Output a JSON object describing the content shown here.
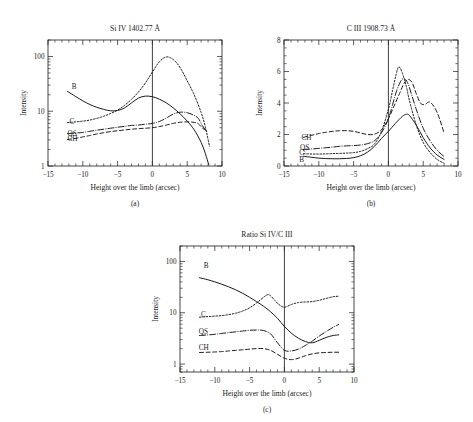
{
  "figure": {
    "panel_captions": [
      "(a)",
      "(b)",
      "(c)"
    ]
  },
  "chart_data": [
    {
      "type": "line",
      "panel": "(a)",
      "title": "Si IV 1402.77 Å",
      "xlabel": "Height over the limb (arcsec)",
      "ylabel": "Intensity",
      "xlim": [
        -15,
        10
      ],
      "ylim": [
        1,
        200
      ],
      "yscale": "log",
      "xscale": "linear",
      "xticks": [
        -15,
        -10,
        -5,
        0,
        5,
        10
      ],
      "xtick_labels": [
        "−15",
        "−10",
        "−5",
        "0",
        "5",
        "10"
      ],
      "yticks": [
        1,
        10,
        100
      ],
      "ytick_labels": [
        "1",
        "10",
        "100"
      ],
      "grid": false,
      "legend": "inline-labels",
      "annotations": [
        {
          "text": "B",
          "x": -11.6,
          "y": 28
        },
        {
          "text": "C",
          "x": -11.9,
          "y": 6.6
        },
        {
          "text": "QS",
          "x": -12.2,
          "y": 4.0
        },
        {
          "text": "CH",
          "x": -12.2,
          "y": 3.2
        }
      ],
      "reference_line_x": 0,
      "series": [
        {
          "name": "B",
          "style": "solid",
          "x": [
            -12.2,
            -11,
            -10,
            -9,
            -8,
            -7,
            -6,
            -5,
            -4,
            -3,
            -2,
            -1,
            0,
            1,
            2,
            3,
            4,
            5,
            6,
            7,
            7.6,
            8.1
          ],
          "y": [
            23,
            18.5,
            15.5,
            13.3,
            11.8,
            10.8,
            10.2,
            10.3,
            11.5,
            14.2,
            17.4,
            18.9,
            18.4,
            16.6,
            14.2,
            11.5,
            8.9,
            6.6,
            4.6,
            2.7,
            1.7,
            1.05
          ]
        },
        {
          "name": "C",
          "style": "dotted",
          "x": [
            -12.2,
            -11,
            -10,
            -9,
            -8,
            -7,
            -6,
            -5,
            -4,
            -3,
            -2,
            -1,
            0,
            1,
            2,
            3,
            4,
            5,
            6,
            7,
            7.6,
            8.2
          ],
          "y": [
            6.2,
            6.4,
            6.6,
            6.9,
            7.4,
            8.1,
            9.1,
            10.5,
            12.8,
            16.5,
            22.5,
            33,
            52,
            80,
            98,
            88,
            62,
            36,
            20,
            9.5,
            5.2,
            2.3
          ]
        },
        {
          "name": "QS",
          "style": "dashdot",
          "x": [
            -12.2,
            -11,
            -10,
            -9,
            -8,
            -7,
            -6,
            -5,
            -4,
            -3,
            -2,
            -1,
            0,
            1,
            2,
            3,
            4,
            5,
            6,
            6.6,
            7.2,
            7.8
          ],
          "y": [
            3.9,
            4.0,
            4.1,
            4.3,
            4.5,
            4.7,
            4.9,
            5.1,
            5.3,
            5.5,
            5.6,
            5.8,
            6.0,
            6.5,
            7.5,
            8.9,
            9.6,
            9.4,
            8.4,
            7.4,
            5.4,
            4.3
          ]
        },
        {
          "name": "CH",
          "style": "dashed",
          "x": [
            -12.2,
            -11,
            -10,
            -9,
            -8,
            -7,
            -6,
            -5,
            -4,
            -3,
            -2,
            -1,
            0,
            1,
            2,
            3,
            4,
            5,
            6,
            6.6,
            7.2,
            7.8
          ],
          "y": [
            3.05,
            3.2,
            3.4,
            3.6,
            3.85,
            4.05,
            4.25,
            4.4,
            4.55,
            4.7,
            4.8,
            4.9,
            5.0,
            5.25,
            5.6,
            6.0,
            6.3,
            6.4,
            6.25,
            5.9,
            4.9,
            4.4
          ]
        }
      ]
    },
    {
      "type": "line",
      "panel": "(b)",
      "title": "C III 1908.73 Å",
      "xlabel": "Height over the limb (arcsec)",
      "ylabel": "Intensity",
      "xlim": [
        -15,
        10
      ],
      "ylim": [
        0,
        8
      ],
      "yscale": "linear",
      "xscale": "linear",
      "xticks": [
        -15,
        -10,
        -5,
        0,
        5,
        10
      ],
      "xtick_labels": [
        "−15",
        "−10",
        "−5",
        "0",
        "5",
        "10"
      ],
      "yticks": [
        0,
        2,
        4,
        6,
        8
      ],
      "ytick_labels": [
        "0",
        "2",
        "4",
        "6",
        "8"
      ],
      "grid": false,
      "legend": "inline-labels",
      "annotations": [
        {
          "text": "CH",
          "x": -12.5,
          "y": 1.82
        },
        {
          "text": "QS",
          "x": -12.7,
          "y": 1.2
        },
        {
          "text": "C",
          "x": -12.8,
          "y": 0.88
        },
        {
          "text": "B",
          "x": -12.8,
          "y": 0.42
        }
      ],
      "reference_line_x": 0,
      "series": [
        {
          "name": "B",
          "style": "solid",
          "x": [
            -12.2,
            -11,
            -10,
            -9,
            -8,
            -7,
            -6,
            -5,
            -4,
            -3,
            -2,
            -1,
            0,
            1,
            2,
            2.6,
            3,
            4,
            5,
            6,
            7,
            8
          ],
          "y": [
            0.62,
            0.55,
            0.5,
            0.47,
            0.46,
            0.46,
            0.48,
            0.53,
            0.65,
            0.88,
            1.25,
            1.75,
            2.2,
            2.7,
            3.15,
            3.28,
            3.22,
            2.6,
            1.8,
            1.15,
            0.7,
            0.42
          ]
        },
        {
          "name": "C",
          "style": "dotted",
          "x": [
            -12.2,
            -11,
            -10,
            -9,
            -8,
            -7,
            -6,
            -5,
            -4,
            -3,
            -2,
            -1,
            0,
            0.6,
            1.1,
            1.5,
            2,
            2.6,
            3,
            4,
            5,
            6,
            7,
            8
          ],
          "y": [
            0.78,
            0.76,
            0.76,
            0.77,
            0.79,
            0.8,
            0.82,
            0.85,
            0.93,
            1.1,
            1.4,
            2.2,
            3.6,
            4.8,
            5.8,
            6.3,
            5.9,
            5.0,
            4.2,
            2.6,
            1.5,
            0.85,
            0.42,
            0.18
          ]
        },
        {
          "name": "QS",
          "style": "dashdot",
          "x": [
            -12.2,
            -11,
            -10,
            -9,
            -8,
            -7,
            -6,
            -5,
            -4,
            -3,
            -2,
            -1,
            0,
            0.6,
            1.2,
            1.8,
            2.2,
            2.6,
            3,
            4,
            5,
            6,
            7,
            8
          ],
          "y": [
            1.05,
            1.08,
            1.12,
            1.16,
            1.2,
            1.25,
            1.28,
            1.3,
            1.33,
            1.42,
            1.6,
            2.1,
            3.0,
            3.9,
            4.8,
            5.4,
            5.55,
            5.4,
            5.0,
            3.6,
            2.4,
            1.6,
            1.0,
            0.6
          ]
        },
        {
          "name": "CH",
          "style": "dashed",
          "x": [
            -12.2,
            -11,
            -10,
            -9,
            -8,
            -7,
            -6,
            -5,
            -4,
            -3,
            -2,
            -1,
            0,
            0.8,
            1.6,
            2.2,
            2.8,
            3.4,
            4,
            4.6,
            5.2,
            6,
            7,
            8
          ],
          "y": [
            1.82,
            1.95,
            2.06,
            2.14,
            2.2,
            2.24,
            2.24,
            2.2,
            2.1,
            2.0,
            2.02,
            2.3,
            3.0,
            3.8,
            4.6,
            5.2,
            5.5,
            5.3,
            4.6,
            4.0,
            3.9,
            4.05,
            3.4,
            2.1
          ]
        }
      ]
    },
    {
      "type": "line",
      "panel": "(c)",
      "title": "Ratio Si IV/C III",
      "xlabel": "Height over the limb (arcsec)",
      "ylabel": "Intensity",
      "xlim": [
        -15,
        10
      ],
      "ylim": [
        0.7,
        200
      ],
      "yscale": "log",
      "xscale": "linear",
      "xticks": [
        -15,
        -10,
        -5,
        0,
        5,
        10
      ],
      "xtick_labels": [
        "−15",
        "−10",
        "−5",
        "0",
        "5",
        "10"
      ],
      "yticks": [
        1,
        10,
        100
      ],
      "ytick_labels": [
        "1",
        "10",
        "100"
      ],
      "grid": false,
      "legend": "inline-labels",
      "annotations": [
        {
          "text": "B",
          "x": -11.6,
          "y": 82
        },
        {
          "text": "C",
          "x": -12.0,
          "y": 9.2
        },
        {
          "text": "QS",
          "x": -12.3,
          "y": 4.3
        },
        {
          "text": "CH",
          "x": -12.3,
          "y": 2.1
        }
      ],
      "reference_line_x": 0,
      "series": [
        {
          "name": "B",
          "style": "solid",
          "x": [
            -12.2,
            -11,
            -10,
            -9,
            -8,
            -7,
            -6,
            -5,
            -4,
            -3,
            -2,
            -1,
            0,
            1,
            2,
            3,
            4,
            5,
            6,
            7,
            7.8
          ],
          "y": [
            48,
            44,
            40,
            36,
            32,
            28,
            24,
            20,
            16.5,
            13.4,
            10.5,
            7.8,
            5.4,
            4.0,
            3.2,
            2.75,
            2.6,
            2.9,
            3.3,
            3.6,
            3.7
          ]
        },
        {
          "name": "C",
          "style": "dotted",
          "x": [
            -12.2,
            -11,
            -10,
            -9,
            -8,
            -7,
            -6,
            -5,
            -4,
            -3,
            -2.4,
            -2,
            -1.4,
            -0.8,
            0,
            1,
            2,
            3,
            4,
            5,
            6,
            7,
            7.8
          ],
          "y": [
            8.2,
            8.4,
            8.6,
            8.8,
            9.2,
            9.8,
            10.8,
            12.5,
            15.5,
            20,
            22.5,
            21.5,
            17.5,
            14.5,
            12.8,
            14.5,
            15.8,
            16.2,
            16.5,
            17.5,
            19,
            20.5,
            21
          ]
        },
        {
          "name": "QS",
          "style": "dashdot",
          "x": [
            -12.2,
            -11,
            -10,
            -9,
            -8,
            -7,
            -6,
            -5,
            -4,
            -3,
            -2,
            -1,
            0,
            1,
            2,
            3,
            4,
            5,
            6,
            7,
            7.8
          ],
          "y": [
            3.6,
            3.7,
            3.8,
            3.95,
            4.1,
            4.25,
            4.4,
            4.55,
            4.6,
            4.5,
            3.9,
            2.6,
            1.85,
            1.8,
            1.95,
            2.3,
            2.8,
            3.5,
            4.3,
            5.2,
            5.9
          ]
        },
        {
          "name": "CH",
          "style": "dashed",
          "x": [
            -12.2,
            -11,
            -10,
            -9,
            -8,
            -7,
            -6,
            -5,
            -4,
            -3,
            -2,
            -1,
            0,
            1,
            2,
            3,
            4,
            5,
            6,
            7,
            7.8
          ],
          "y": [
            1.68,
            1.7,
            1.72,
            1.75,
            1.8,
            1.85,
            1.9,
            1.95,
            2.0,
            2.0,
            1.85,
            1.55,
            1.3,
            1.22,
            1.3,
            1.45,
            1.58,
            1.65,
            1.68,
            1.7,
            1.7
          ]
        }
      ]
    }
  ]
}
